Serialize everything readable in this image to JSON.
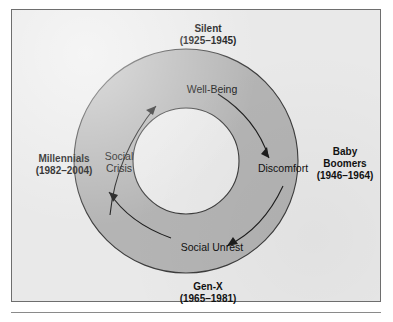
{
  "figure": {
    "type": "cycle-diagram",
    "shape": "donut-ring",
    "direction": "clockwise",
    "colors": {
      "background": "#e9e9e9",
      "ring_fill": "#b4b4b4",
      "ring_stroke": "#3d3d3d",
      "hole_fill": "#e9e9e9",
      "text": "#111111",
      "frame_border": "#6e6e6e"
    },
    "generations": [
      {
        "id": "silent",
        "position": "top",
        "name": "Silent",
        "years": "(1925–1945)"
      },
      {
        "id": "baby-boomers",
        "position": "right",
        "name": "Baby",
        "name2": "Boomers",
        "years": "(1946–1964)"
      },
      {
        "id": "gen-x",
        "position": "bottom",
        "name": "Gen-X",
        "years": "(1965–1981)"
      },
      {
        "id": "millennials",
        "position": "left",
        "name": "Millennials",
        "years": "(1982–2004)"
      }
    ],
    "stages": [
      {
        "id": "well-being",
        "position": "top",
        "label": "Well-Being"
      },
      {
        "id": "discomfort",
        "position": "right",
        "label": "Discomfort"
      },
      {
        "id": "social-unrest",
        "position": "bottom",
        "label": "Social Unrest"
      },
      {
        "id": "social-crisis",
        "position": "left",
        "label": "Social",
        "label2": "Crisis"
      }
    ],
    "arrows": [
      {
        "id": "well-being-to-discomfort",
        "from": "Well-Being",
        "to": "Discomfort"
      },
      {
        "id": "discomfort-to-social-unrest",
        "from": "Discomfort",
        "to": "Social Unrest"
      },
      {
        "id": "social-unrest-to-social-crisis",
        "from": "Social Unrest",
        "to": "Social Crisis"
      },
      {
        "id": "social-crisis-to-well-being",
        "from": "Social Crisis",
        "to": "Well-Being"
      }
    ]
  }
}
